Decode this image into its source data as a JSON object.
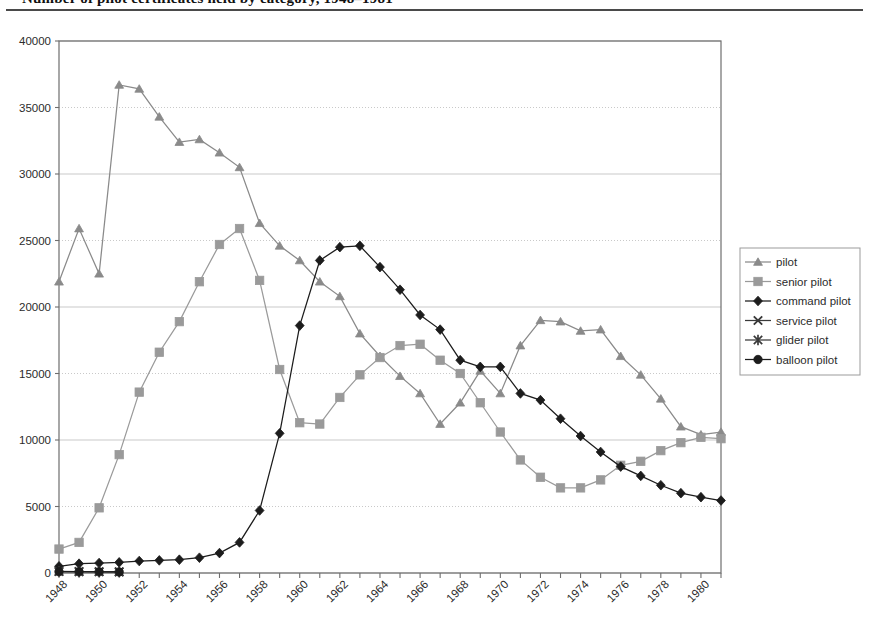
{
  "caption": {
    "text": "Number of pilot certificates held by category, 1948–1981"
  },
  "chart_data": {
    "type": "line",
    "title": "",
    "xlabel": "",
    "ylabel": "",
    "xlim": [
      1948,
      1981
    ],
    "ylim": [
      0,
      40000
    ],
    "y_ticks": [
      0,
      5000,
      10000,
      15000,
      20000,
      25000,
      30000,
      35000,
      40000
    ],
    "y_tick_labels": [
      "0",
      "5000",
      "10000",
      "15000",
      "20000",
      "25000",
      "30000",
      "35000",
      "40000"
    ],
    "x": [
      1948,
      1949,
      1950,
      1951,
      1952,
      1953,
      1954,
      1955,
      1956,
      1957,
      1958,
      1959,
      1960,
      1961,
      1962,
      1963,
      1964,
      1965,
      1966,
      1967,
      1968,
      1969,
      1970,
      1971,
      1972,
      1973,
      1974,
      1975,
      1976,
      1977,
      1978,
      1979,
      1980,
      1981
    ],
    "x_tick_labels": [
      "1948",
      "1950",
      "1952",
      "1954",
      "1956",
      "1958",
      "1960",
      "1962",
      "1964",
      "1966",
      "1968",
      "1970",
      "1972",
      "1974",
      "1976",
      "1978",
      "1980"
    ],
    "x_tick_step": 2,
    "grid": true,
    "legend_position": "right",
    "series": [
      {
        "name": "pilot",
        "marker": "triangle",
        "color": "#8a8a8a",
        "values": [
          21900,
          25900,
          22500,
          36700,
          36400,
          34300,
          32400,
          32600,
          31600,
          30500,
          26300,
          24600,
          23500,
          21900,
          20800,
          18000,
          16300,
          14800,
          13500,
          11200,
          12800,
          15200,
          13500,
          17100,
          19000,
          18900,
          18200,
          18300,
          16300,
          14900,
          13100,
          11000,
          10400,
          10600
        ]
      },
      {
        "name": "senior pilot",
        "marker": "square",
        "color": "#9a9a9a",
        "values": [
          1800,
          2300,
          4900,
          8900,
          13600,
          16600,
          18900,
          21900,
          24700,
          25900,
          22000,
          15300,
          11300,
          11200,
          13200,
          14900,
          16200,
          17100,
          17200,
          16000,
          15000,
          12800,
          10600,
          8500,
          7200,
          6400,
          6400,
          7000,
          8100,
          8400,
          9200,
          9800,
          10200,
          10100
        ]
      },
      {
        "name": "command pilot",
        "marker": "diamond",
        "color": "#1c1c1c",
        "values": [
          500,
          700,
          750,
          800,
          900,
          950,
          1000,
          1150,
          1500,
          2300,
          4700,
          10500,
          18600,
          23500,
          24500,
          24600,
          23000,
          21300,
          19400,
          18300,
          16000,
          15500,
          15500,
          13500,
          13000,
          11600,
          10300,
          9100,
          8000,
          7300,
          6600,
          6000,
          5700,
          5450
        ]
      },
      {
        "name": "service pilot",
        "marker": "cross",
        "color": "#3a3a3a",
        "values": [
          120,
          110,
          100,
          90,
          null,
          null,
          null,
          null,
          null,
          null,
          null,
          null,
          null,
          null,
          null,
          null,
          null,
          null,
          null,
          null,
          null,
          null,
          null,
          null,
          null,
          null,
          null,
          null,
          null,
          null,
          null,
          null,
          null,
          null
        ]
      },
      {
        "name": "glider pilot",
        "marker": "asterisk",
        "color": "#3a3a3a",
        "values": [
          110,
          100,
          95,
          85,
          null,
          null,
          null,
          null,
          null,
          null,
          null,
          null,
          null,
          null,
          null,
          null,
          null,
          null,
          null,
          null,
          null,
          null,
          null,
          null,
          null,
          null,
          null,
          null,
          null,
          null,
          null,
          null,
          null,
          null
        ]
      },
      {
        "name": "balloon pilot",
        "marker": "circle",
        "color": "#1c1c1c",
        "values": [
          100,
          95,
          90,
          80,
          null,
          null,
          null,
          null,
          null,
          null,
          null,
          null,
          null,
          null,
          null,
          null,
          null,
          null,
          null,
          null,
          null,
          null,
          null,
          null,
          null,
          null,
          null,
          null,
          null,
          null,
          null,
          null,
          null,
          null
        ]
      }
    ]
  },
  "legend": {
    "items": [
      {
        "label": "pilot",
        "marker": "triangle",
        "color": "#8a8a8a"
      },
      {
        "label": "senior pilot",
        "marker": "square",
        "color": "#9a9a9a"
      },
      {
        "label": "command pilot",
        "marker": "diamond",
        "color": "#1c1c1c"
      },
      {
        "label": "service pilot",
        "marker": "cross",
        "color": "#3a3a3a"
      },
      {
        "label": "glider pilot",
        "marker": "asterisk",
        "color": "#3a3a3a"
      },
      {
        "label": "balloon pilot",
        "marker": "circle",
        "color": "#1c1c1c"
      }
    ]
  }
}
